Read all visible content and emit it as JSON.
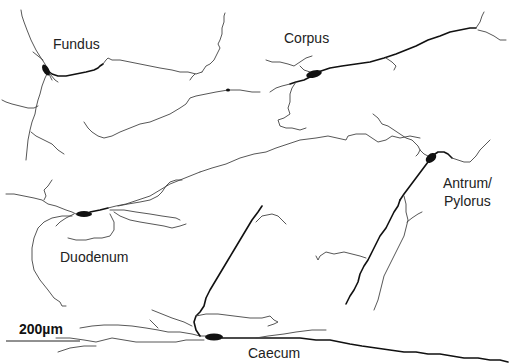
{
  "figure": {
    "type": "neuron-tracings",
    "background": "#ffffff",
    "trace_color": "#444444",
    "soma_color": "#111111"
  },
  "labels": {
    "fundus": "Fundus",
    "corpus": "Corpus",
    "antrum_line1": "Antrum/",
    "antrum_line2": "Pylorus",
    "duodenum": "Duodenum",
    "caecum": "Caecum"
  },
  "scale_bar": {
    "label": "200µm",
    "length_px": 66
  },
  "neurons": [
    {
      "region": "Fundus",
      "soma": [
        47,
        70
      ]
    },
    {
      "region": "Corpus",
      "soma": [
        316,
        74
      ]
    },
    {
      "region": "Antrum/Pylorus",
      "soma": [
        430,
        158
      ]
    },
    {
      "region": "Duodenum",
      "soma": [
        84,
        214
      ]
    },
    {
      "region": "Caecum",
      "soma": [
        213,
        337
      ]
    }
  ]
}
